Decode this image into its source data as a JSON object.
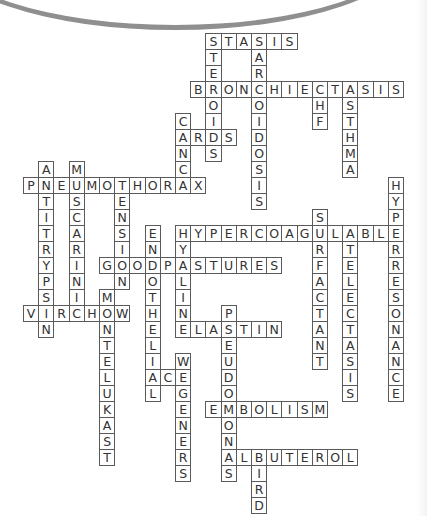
{
  "puzzle": {
    "type": "crossword",
    "grid_origin": {
      "x": 23,
      "y": 33
    },
    "cell_size": {
      "w": 15.2,
      "h": 16
    },
    "colors": {
      "border": "#5a5a5a",
      "letter": "#333333",
      "background": "#ffffff",
      "arc": "#8f8f8f"
    },
    "words": [
      {
        "answer": "STASIS",
        "row": 0,
        "col": 12,
        "dir": "across"
      },
      {
        "answer": "STEROIDS",
        "row": 0,
        "col": 12,
        "dir": "down"
      },
      {
        "answer": "SARCOIDOSIS",
        "row": 0,
        "col": 15,
        "dir": "down"
      },
      {
        "answer": "BRONCHIECTASIS",
        "row": 3,
        "col": 11,
        "dir": "across"
      },
      {
        "answer": "CHF",
        "row": 3,
        "col": 19,
        "dir": "down"
      },
      {
        "answer": "ASTHMA",
        "row": 3,
        "col": 21,
        "dir": "down"
      },
      {
        "answer": "CANCA",
        "row": 5,
        "col": 10,
        "dir": "down"
      },
      {
        "answer": "ARDS",
        "row": 6,
        "col": 10,
        "dir": "across"
      },
      {
        "answer": "ANTITRYPSIN",
        "row": 8,
        "col": 1,
        "dir": "down"
      },
      {
        "answer": "MUSCARINIC",
        "row": 8,
        "col": 3,
        "dir": "down"
      },
      {
        "answer": "PNEUMOTHORAX",
        "row": 9,
        "col": 0,
        "dir": "across"
      },
      {
        "answer": "TENSION",
        "row": 9,
        "col": 6,
        "dir": "down"
      },
      {
        "answer": "HYPERRESONANCE",
        "row": 9,
        "col": 24,
        "dir": "down"
      },
      {
        "answer": "SURFACTANT",
        "row": 11,
        "col": 19,
        "dir": "down"
      },
      {
        "answer": "ENDOTHELIAL",
        "row": 12,
        "col": 8,
        "dir": "down"
      },
      {
        "answer": "HYPERCOAGULABLE",
        "row": 12,
        "col": 10,
        "dir": "across"
      },
      {
        "answer": "HYALINE",
        "row": 12,
        "col": 10,
        "dir": "down"
      },
      {
        "answer": "ATELECTASIS",
        "row": 12,
        "col": 21,
        "dir": "down"
      },
      {
        "answer": "GOODPASTURES",
        "row": 14,
        "col": 5,
        "dir": "across"
      },
      {
        "answer": "MONTELUKAST",
        "row": 16,
        "col": 5,
        "dir": "down"
      },
      {
        "answer": "VIRCHOW",
        "row": 17,
        "col": 0,
        "dir": "across"
      },
      {
        "answer": "PSEUDOMONAS",
        "row": 17,
        "col": 13,
        "dir": "down"
      },
      {
        "answer": "ELASTIN",
        "row": 18,
        "col": 10,
        "dir": "across"
      },
      {
        "answer": "WEGENERS",
        "row": 20,
        "col": 10,
        "dir": "down"
      },
      {
        "answer": "ACE",
        "row": 21,
        "col": 8,
        "dir": "across"
      },
      {
        "answer": "EMBOLISM",
        "row": 23,
        "col": 12,
        "dir": "across"
      },
      {
        "answer": "ALBUTEROL",
        "row": 26,
        "col": 13,
        "dir": "across"
      },
      {
        "answer": "BIRD",
        "row": 26,
        "col": 15,
        "dir": "down"
      }
    ]
  }
}
